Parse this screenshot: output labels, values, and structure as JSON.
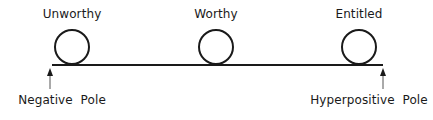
{
  "diagram": {
    "nodes": [
      {
        "label": "Unworthy",
        "x": 72
      },
      {
        "label": "Worthy",
        "x": 216
      },
      {
        "label": "Entitled",
        "x": 359
      }
    ],
    "poles": {
      "left": "Negative  Pole",
      "right": "Hyperpositive  Pole"
    },
    "colors": {
      "stroke": "#1a1a1a",
      "arrow": "#333333"
    }
  }
}
